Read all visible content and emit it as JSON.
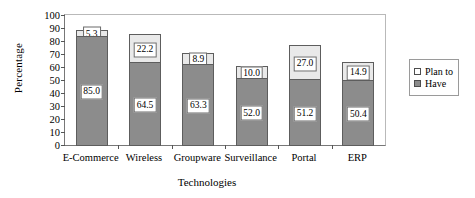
{
  "chart_data": {
    "type": "bar",
    "stacked": true,
    "title": "",
    "xlabel": "Technologies",
    "ylabel": "Percentage",
    "ylim": [
      0,
      100
    ],
    "ytick_step": 10,
    "yticks": [
      "100",
      "90",
      "80",
      "70",
      "60",
      "50",
      "40",
      "30",
      "20",
      "10",
      "0"
    ],
    "grid": false,
    "legend_position": "right",
    "categories": [
      "E-Commerce",
      "Wireless",
      "Groupware",
      "Surveillance",
      "Portal",
      "ERP"
    ],
    "series": [
      {
        "name": "Have",
        "color": "#8c8c8c",
        "values": [
          85.0,
          64.5,
          63.3,
          52.0,
          51.2,
          50.4
        ],
        "labels": [
          "85.0",
          "64.5",
          "63.3",
          "52.0",
          "51.2",
          "50.4"
        ]
      },
      {
        "name": "Plan to",
        "color": "#e9e9e9",
        "values": [
          5.3,
          22.2,
          8.9,
          10.0,
          27.0,
          14.9
        ],
        "labels": [
          "5.3",
          "22.2",
          "8.9",
          "10.0",
          "27.0",
          "14.9"
        ]
      }
    ],
    "totals": [
      90.3,
      86.7,
      72.2,
      62.0,
      78.2,
      65.3
    ]
  },
  "legend": {
    "items": [
      {
        "label": "Plan to",
        "swatch": "plan"
      },
      {
        "label": "Have",
        "swatch": "have"
      }
    ]
  }
}
